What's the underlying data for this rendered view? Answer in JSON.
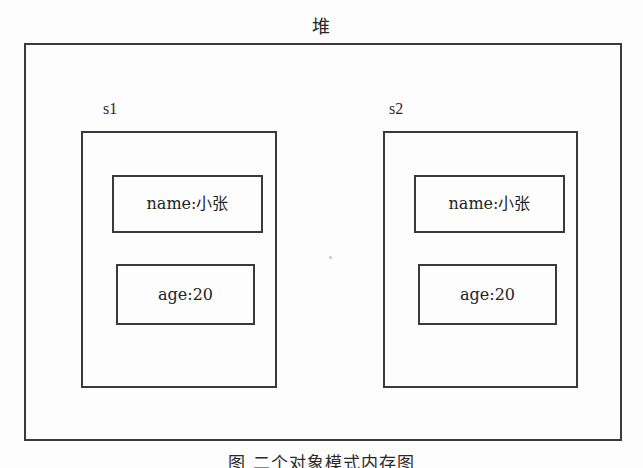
{
  "figure": {
    "heap_title": "堆",
    "caption": "图    二个对象模式内存图",
    "colors": {
      "page_background": "#fdfdfd",
      "stroke": "#3a3a3a",
      "text": "#242424",
      "speck": "#b9b9bd"
    }
  },
  "objects": [
    {
      "ref_label": "s1",
      "fields": [
        {
          "key": "name",
          "text": "name:小张"
        },
        {
          "key": "age",
          "text": "age:20"
        }
      ]
    },
    {
      "ref_label": "s2",
      "fields": [
        {
          "key": "name",
          "text": "name:小张"
        },
        {
          "key": "age",
          "text": "age:20"
        }
      ]
    }
  ]
}
